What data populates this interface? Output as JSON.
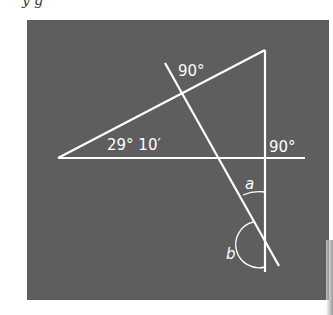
{
  "figure": {
    "top_fragment": "y g",
    "background_color": "#5e5e5e",
    "line_color": "#ffffff",
    "labels": {
      "left_angle": "29° 10′",
      "top_right_angle": "90°",
      "bottom_right_angle": "90°",
      "angle_a": "a",
      "angle_b": "b"
    }
  }
}
